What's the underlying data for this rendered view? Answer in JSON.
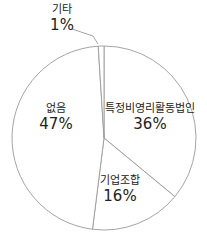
{
  "chart_data": {
    "type": "pie",
    "title": "",
    "start_angle_deg": -90,
    "direction": "clockwise",
    "categories": [
      "특정비영리활동법인",
      "기업조합",
      "없음",
      "기타"
    ],
    "values": [
      36,
      16,
      47,
      1
    ],
    "labels": [
      {
        "name": "특정비영리활동법인",
        "pct": "36%"
      },
      {
        "name": "기업조합",
        "pct": "16%"
      },
      {
        "name": "없음",
        "pct": "47%"
      },
      {
        "name": "기타",
        "pct": "1%"
      }
    ],
    "fill_color": "#ffffff",
    "stroke_color": "#9a9a9a",
    "legend": "none"
  }
}
